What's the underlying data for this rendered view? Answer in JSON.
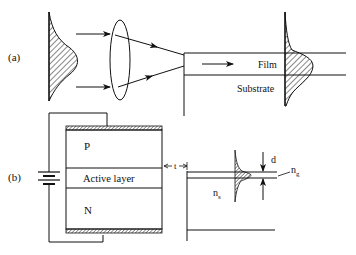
{
  "panels": {
    "a": {
      "label": "(a)",
      "film_label": "Film",
      "substrate_label": "Substrate"
    },
    "b": {
      "label": "(b)",
      "p_label": "P",
      "active_label": "Active layer",
      "n_label": "N",
      "gap_label": "t",
      "thickness_label": "d",
      "guide_index_main": "n",
      "guide_index_sub": "g",
      "substrate_index_main": "n",
      "substrate_index_sub": "s"
    }
  },
  "colors": {
    "stroke": "#111111",
    "background": "#ffffff"
  }
}
